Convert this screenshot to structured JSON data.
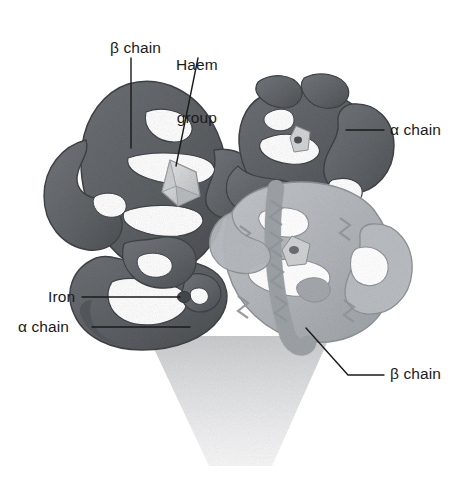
{
  "figure": {
    "background_color": "#ffffff",
    "width": 463,
    "height": 491
  },
  "labels": {
    "beta_chain_top": "β chain",
    "haem_group_line1": "Haem",
    "haem_group_line2": "group",
    "alpha_chain_right": "α chain",
    "iron": "Iron",
    "alpha_chain_left": "α chain",
    "beta_chain_bottom": "β chain"
  },
  "leader_lines": [
    {
      "name": "beta-chain-top-leader",
      "from": [
        131,
        58
      ],
      "to": [
        131,
        148
      ]
    },
    {
      "name": "haem-group-leader",
      "from": [
        198,
        58
      ],
      "to": [
        176,
        165
      ]
    },
    {
      "name": "alpha-chain-right-leader",
      "from": [
        384,
        130
      ],
      "to": [
        346,
        130
      ]
    },
    {
      "name": "iron-leader",
      "from": [
        82,
        297
      ],
      "to": [
        180,
        297
      ]
    },
    {
      "name": "alpha-chain-left-leader",
      "from": [
        92,
        327
      ],
      "to": [
        188,
        327
      ]
    },
    {
      "name": "beta-chain-bottom-leader",
      "from": [
        384,
        375
      ],
      "to": [
        350,
        375
      ],
      "elbow": [
        308,
        330
      ]
    }
  ],
  "colors": {
    "chain_dark": "#63676b",
    "chain_dark_shade": "#4b4f53",
    "chain_light": "#b3b7bb",
    "chain_light_shade": "#9ba0a4",
    "haem_plate": "#d6d8da",
    "iron_dot": "#4a4e52",
    "shadow_cone_top": "#d0d2d4",
    "shadow_cone_bottom": "#f4f4f5",
    "leader_line": "#1a1a1a",
    "text": "#1a1a1a"
  },
  "subunits": [
    {
      "name": "beta-chain-upper-left",
      "shade": "dark",
      "label": "β chain"
    },
    {
      "name": "alpha-chain-upper-right",
      "shade": "dark",
      "label": "α chain"
    },
    {
      "name": "alpha-chain-lower-left",
      "shade": "dark",
      "label": "α chain"
    },
    {
      "name": "beta-chain-lower-right",
      "shade": "light",
      "label": "β chain"
    }
  ],
  "features": [
    {
      "name": "haem-group",
      "label": "Haem group",
      "location": "beta-chain-upper-left"
    },
    {
      "name": "iron-atom",
      "label": "Iron",
      "location": "alpha-chain-lower-left"
    }
  ]
}
